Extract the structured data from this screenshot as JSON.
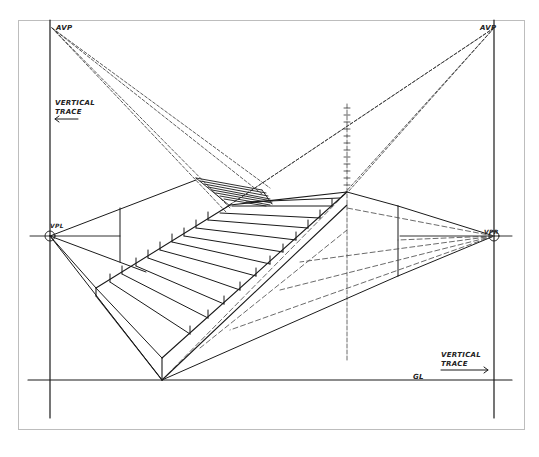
{
  "labels": {
    "avp_left": "AVP",
    "avp_right": "AVP",
    "vpl": "VPL",
    "vpr": "VPR",
    "vertical_trace_left_line1": "VERTICAL",
    "vertical_trace_left_line2": "TRACE",
    "vertical_trace_right_line1": "VERTICAL",
    "vertical_trace_right_line2": "TRACE",
    "ground_line": "GL"
  },
  "points": {
    "AVP_left": [
      52,
      28
    ],
    "AVP_right": [
      494,
      28
    ],
    "VPL": [
      50,
      236
    ],
    "VPR": [
      494,
      236
    ],
    "stair_base_corner": [
      162,
      380
    ]
  },
  "lines": {
    "horizon_y": 236,
    "ground_line_y": 380,
    "vertical_trace_left_x": 50,
    "vertical_trace_right_x": 494
  },
  "stairs": {
    "step_count": 13
  },
  "colors": {
    "ink": "#1a1a1a",
    "construction": "#555555",
    "frame": "#bdbdbd",
    "paper": "#ffffff"
  }
}
